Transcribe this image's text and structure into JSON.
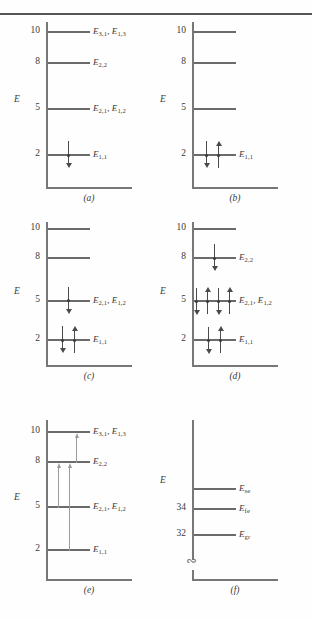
{
  "figure": {
    "axis_label": "E",
    "panels": [
      {
        "id": "a",
        "caption": "(a)",
        "axis_label": "E",
        "ticks": [
          "10",
          "8",
          "5",
          "2"
        ],
        "levels": [
          {
            "energy": "10",
            "label": "E3,1 , E1,3",
            "label_html": "E<sub>3,1</sub>, E<sub>1,3</sub>",
            "occupancy": []
          },
          {
            "energy": "8",
            "label": "E2,2",
            "label_html": "E<sub>2,2</sub>",
            "occupancy": []
          },
          {
            "energy": "5",
            "label": "E2,1 , E1,2",
            "label_html": "E<sub>2,1</sub>, E<sub>1,2</sub>",
            "occupancy": []
          },
          {
            "energy": "2",
            "label": "E1,1",
            "label_html": "E<sub>1,1</sub>",
            "occupancy": [
              "down"
            ]
          }
        ]
      },
      {
        "id": "b",
        "caption": "(b)",
        "axis_label": "E",
        "ticks": [
          "10",
          "8",
          "5",
          "2"
        ],
        "levels": [
          {
            "energy": "10",
            "label": "",
            "label_html": "",
            "occupancy": []
          },
          {
            "energy": "8",
            "label": "",
            "label_html": "",
            "occupancy": []
          },
          {
            "energy": "5",
            "label": "",
            "label_html": "",
            "occupancy": []
          },
          {
            "energy": "2",
            "label": "E1,1",
            "label_html": "E<sub>1,1</sub>",
            "occupancy": [
              "down",
              "up"
            ]
          }
        ]
      },
      {
        "id": "c",
        "caption": "(c)",
        "axis_label": "E",
        "ticks": [
          "10",
          "8",
          "5",
          "2"
        ],
        "levels": [
          {
            "energy": "10",
            "label": "",
            "label_html": "",
            "occupancy": []
          },
          {
            "energy": "8",
            "label": "",
            "label_html": "",
            "occupancy": []
          },
          {
            "energy": "5",
            "label": "E2,1 , E1,2",
            "label_html": "E<sub>2,1</sub>, E<sub>1,2</sub>",
            "occupancy": [
              "down"
            ]
          },
          {
            "energy": "2",
            "label": "E1,1",
            "label_html": "E<sub>1,1</sub>",
            "occupancy": [
              "down",
              "up"
            ]
          }
        ]
      },
      {
        "id": "d",
        "caption": "(d)",
        "axis_label": "E",
        "ticks": [
          "10",
          "8",
          "5",
          "2"
        ],
        "levels": [
          {
            "energy": "10",
            "label": "",
            "label_html": "",
            "occupancy": []
          },
          {
            "energy": "8",
            "label": "E2,2",
            "label_html": "E<sub>2,2</sub>",
            "occupancy": [
              "down"
            ]
          },
          {
            "energy": "5",
            "label": "E2,1 , E1,2",
            "label_html": "E<sub>2,1</sub>, E<sub>1,2</sub>",
            "occupancy": [
              "down",
              "up",
              "down",
              "up"
            ]
          },
          {
            "energy": "2",
            "label": "E1,1",
            "label_html": "E<sub>1,1</sub>",
            "occupancy": [
              "down",
              "up"
            ]
          }
        ]
      },
      {
        "id": "e",
        "caption": "(e)",
        "axis_label": "E",
        "ticks": [
          "10",
          "8",
          "5",
          "2"
        ],
        "levels": [
          {
            "energy": "10",
            "label": "E3,1 , E1,3",
            "label_html": "E<sub>3,1</sub>, E<sub>1,3</sub>",
            "occupancy": []
          },
          {
            "energy": "8",
            "label": "E2,2",
            "label_html": "E<sub>2,2</sub>",
            "occupancy": []
          },
          {
            "energy": "5",
            "label": "E2,1 , E1,2",
            "label_html": "E<sub>2,1</sub>, E<sub>1,2</sub>",
            "occupancy": []
          },
          {
            "energy": "2",
            "label": "E1,1",
            "label_html": "E<sub>1,1</sub>",
            "occupancy": []
          }
        ],
        "transitions": [
          {
            "from": "8",
            "to": "10"
          },
          {
            "from": "5",
            "to": "8"
          },
          {
            "from": "2",
            "to": "8"
          }
        ]
      },
      {
        "id": "f",
        "caption": "(f)",
        "axis_label": "E",
        "ticks": [
          "34",
          "32"
        ],
        "axis_break": true,
        "levels": [
          {
            "energy": "",
            "label": "Ese",
            "label_html": "E<sub>se</sub>",
            "occupancy": []
          },
          {
            "energy": "34",
            "label": "Efe",
            "label_html": "E<sub>fe</sub>",
            "occupancy": []
          },
          {
            "energy": "32",
            "label": "Egr",
            "label_html": "E<sub>gr</sub>",
            "occupancy": []
          }
        ]
      }
    ]
  },
  "colors": {
    "level": "#6b6b6b",
    "axis": "#777777",
    "spin_arrow": "#4a4a4a",
    "transition_arrow": "#9a9a9a",
    "text": "#3a3a3a",
    "background": "#fefefe"
  }
}
